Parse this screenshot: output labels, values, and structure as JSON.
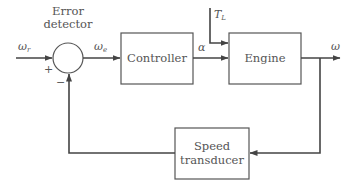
{
  "diagram": {
    "type": "closed-loop speed control block diagram",
    "summing_junction": {
      "label_line1": "Error",
      "label_line2": "detector",
      "plus_sign": "+",
      "minus_sign": "−"
    },
    "blocks": {
      "controller": "Controller",
      "engine": "Engine",
      "transducer_line1": "Speed",
      "transducer_line2": "transducer"
    },
    "signals": {
      "reference": {
        "symbol": "ω",
        "subscript": "r"
      },
      "error": {
        "symbol": "ω",
        "subscript": "e"
      },
      "control": {
        "symbol": "α"
      },
      "load_torque": {
        "symbol": "T",
        "subscript": "L"
      },
      "output": {
        "symbol": "ω"
      }
    },
    "colors": {
      "line": "#444444",
      "text": "#555555",
      "background": "#ffffff"
    }
  }
}
